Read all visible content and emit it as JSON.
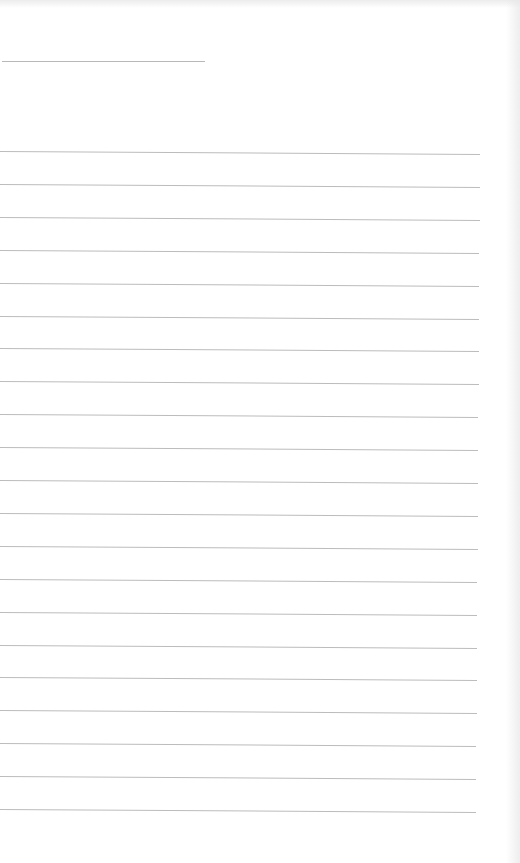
{
  "page": {
    "type": "blank ruled sheet",
    "background_color": "#ffffff",
    "line_color": "#bcbcbc"
  },
  "title_line": {
    "x1": 2,
    "x2": 205,
    "y": 61
  },
  "ruled_lines": {
    "count": 21,
    "left_x": 0,
    "right_x": 480,
    "first_y_left": 151,
    "spacing": 32.9,
    "slope_px_over_width": 3
  }
}
